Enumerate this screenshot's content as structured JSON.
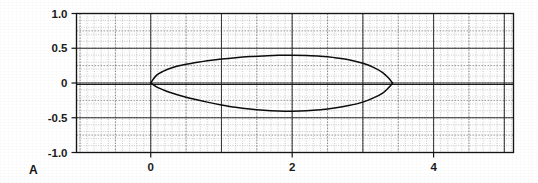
{
  "figure": {
    "panel_label": "A",
    "background_color": "#ffffff",
    "ink_color": "#0d0d0d"
  },
  "chart_data": {
    "type": "line",
    "title": "",
    "subtitle": "",
    "xlabel": "",
    "ylabel": "",
    "xlim": [
      -1.05,
      5.13
    ],
    "ylim": [
      -1.0,
      1.0
    ],
    "grid": true,
    "grid_style": "fine dotted graph paper with major rules at integer x and 0.5 y",
    "legend": "none",
    "annotations": [
      "A"
    ],
    "xticks": [
      0,
      2,
      4
    ],
    "xticklabels": [
      "0",
      "2",
      "4"
    ],
    "x_major_gridlines": [
      0,
      1,
      2,
      3,
      4,
      5
    ],
    "x_minor_step": 0.1,
    "yticks": [
      1.0,
      0.5,
      0,
      -0.5,
      -1.0
    ],
    "yticklabels": [
      "1.0",
      "0.5",
      "0",
      "-0.5",
      "-1.0"
    ],
    "y_major_gridlines": [
      -1.0,
      -0.5,
      0,
      0.5,
      1.0
    ],
    "y_minor_step": 0.1,
    "series": [
      {
        "name": "upper-surface",
        "x": [
          0.0,
          0.08,
          0.18,
          0.3,
          0.45,
          0.62,
          0.8,
          1.0,
          1.2,
          1.4,
          1.6,
          1.8,
          2.0,
          2.2,
          2.4,
          2.6,
          2.8,
          3.0,
          3.15,
          3.28,
          3.36,
          3.42
        ],
        "y": [
          0.0,
          0.11,
          0.17,
          0.22,
          0.26,
          0.29,
          0.32,
          0.345,
          0.365,
          0.38,
          0.39,
          0.398,
          0.4,
          0.395,
          0.385,
          0.365,
          0.335,
          0.285,
          0.225,
          0.15,
          0.075,
          0.0
        ]
      },
      {
        "name": "lower-surface",
        "x": [
          0.0,
          0.08,
          0.18,
          0.3,
          0.45,
          0.62,
          0.8,
          1.0,
          1.2,
          1.4,
          1.6,
          1.8,
          2.0,
          2.2,
          2.4,
          2.6,
          2.8,
          3.0,
          3.15,
          3.28,
          3.36,
          3.42
        ],
        "y": [
          0.0,
          -0.055,
          -0.1,
          -0.145,
          -0.19,
          -0.235,
          -0.275,
          -0.315,
          -0.35,
          -0.375,
          -0.392,
          -0.402,
          -0.405,
          -0.4,
          -0.385,
          -0.36,
          -0.325,
          -0.275,
          -0.215,
          -0.145,
          -0.072,
          0.0
        ]
      }
    ],
    "leading_edge": [
      0.0,
      0.0
    ],
    "trailing_edge": [
      3.42,
      0.0
    ],
    "max_thickness_upper": 0.4,
    "max_thickness_lower": -0.405
  }
}
